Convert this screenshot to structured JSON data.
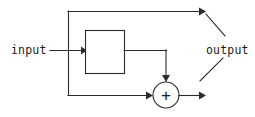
{
  "diagram": {
    "canvas": {
      "width": 255,
      "height": 117,
      "background": "#ffffff"
    },
    "stroke_color": "#2b2b2b",
    "text_color": "#1a1a1a",
    "labels": {
      "input": "input",
      "output": "output",
      "adder_symbol": "+"
    },
    "nodes": [
      {
        "name": "processing-block",
        "type": "rect",
        "label": "",
        "x": 85,
        "y": 30,
        "width": 39,
        "height": 43
      },
      {
        "name": "summing-junction",
        "type": "circle",
        "label": "+",
        "cx": 166,
        "cy": 95,
        "r": 13
      }
    ],
    "edges": [
      {
        "name": "input-to-block",
        "from": "input",
        "to": "processing-block",
        "arrow": true
      },
      {
        "name": "input-tap-to-top-branch",
        "from": "input",
        "to": "output",
        "arrow": true
      },
      {
        "name": "block-to-adder",
        "from": "processing-block",
        "to": "summing-junction",
        "arrow": true
      },
      {
        "name": "bypass-to-adder",
        "from": "input",
        "to": "summing-junction",
        "arrow": true
      },
      {
        "name": "adder-to-output",
        "from": "summing-junction",
        "to": "output",
        "arrow": true
      }
    ]
  }
}
